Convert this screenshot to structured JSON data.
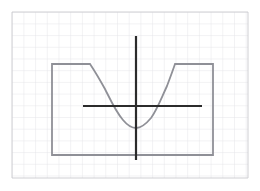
{
  "figure": {
    "title": "",
    "background_color": "#ffffff",
    "grid": {
      "visible": true,
      "minor_color": "#e3e3e8",
      "major_color": "#bfc0c6",
      "cell_size_px": 11.7,
      "x_start": 12,
      "x_end": 248,
      "y_start": 12,
      "y_end": 178,
      "major_every": 1
    },
    "axes": {
      "color": "#2b2b2b",
      "stroke_width": 2.2,
      "origin": {
        "x": 136,
        "y": 106
      },
      "x_axis": {
        "x1": 83,
        "y1": 106,
        "x2": 202,
        "y2": 106
      },
      "y_axis": {
        "x1": 136,
        "y1": 36,
        "x2": 136,
        "y2": 160
      }
    },
    "curve": {
      "color": "#8f9097",
      "stroke_width": 1.8,
      "description": "square-well / bathtub potential with rounded parabolic bottom",
      "points_px": [
        [
          52,
          155
        ],
        [
          52,
          64
        ],
        [
          90,
          64
        ],
        [
          103,
          86
        ],
        [
          113,
          104
        ],
        [
          120,
          116
        ],
        [
          127,
          124
        ],
        [
          136,
          128
        ],
        [
          145,
          125
        ],
        [
          152,
          118
        ],
        [
          159,
          106
        ],
        [
          168,
          82
        ],
        [
          175,
          64
        ],
        [
          213,
          64
        ],
        [
          213,
          155
        ],
        [
          52,
          155
        ]
      ],
      "flat_top_left": {
        "x1": 52,
        "x2": 90,
        "y": 64
      },
      "flat_top_right": {
        "x1": 175,
        "x2": 213,
        "y": 64
      },
      "minimum": {
        "x": 136,
        "y": 128
      },
      "bottom_edge_y": 155,
      "left_wall_x": 52,
      "right_wall_x": 213
    }
  },
  "chart_data": {
    "type": "line",
    "title": "",
    "xlabel": "",
    "ylabel": "",
    "grid": true,
    "legend": null,
    "xlim": [
      -4.5,
      4.5
    ],
    "ylim": [
      -2.2,
      2.4
    ],
    "series": [
      {
        "name": "potential-well-curve",
        "color": "#8f9097",
        "x": [
          -3.6,
          -3.6,
          -2.1,
          -1.0,
          -0.6,
          -0.1,
          0.0,
          0.35,
          0.9,
          1.6,
          2.0,
          3.35,
          3.35,
          -3.6
        ],
        "y": [
          -1.7,
          1.45,
          1.45,
          0.6,
          0.05,
          -0.55,
          -0.7,
          -0.6,
          -0.2,
          0.55,
          1.45,
          1.45,
          -1.7,
          -1.7
        ]
      }
    ],
    "annotations": [
      {
        "label": "flat left plateau",
        "x_range": [
          -3.6,
          -2.1
        ],
        "y": 1.45
      },
      {
        "label": "flat right plateau",
        "x_range": [
          2.0,
          3.35
        ],
        "y": 1.45
      },
      {
        "label": "minimum",
        "x": 0.0,
        "y": -0.7
      }
    ]
  }
}
